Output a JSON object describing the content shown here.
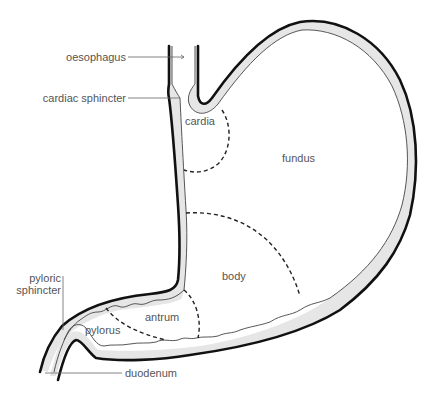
{
  "diagram": {
    "type": "anatomical-diagram",
    "labels": {
      "oesophagus": "oesophagus",
      "cardiac_sphincter": "cardiac sphincter",
      "cardia": "cardia",
      "fundus": "fundus",
      "body": "body",
      "antrum": "antrum",
      "pylorus": "pylorus",
      "pyloric_sphincter_line1": "pyloric",
      "pyloric_sphincter_line2": "sphincter",
      "duodenum": "duodenum"
    },
    "colors": {
      "outline": "#111111",
      "wall_fill": "#e6e6e6",
      "label_text": "#555555",
      "background": "#ffffff"
    }
  }
}
